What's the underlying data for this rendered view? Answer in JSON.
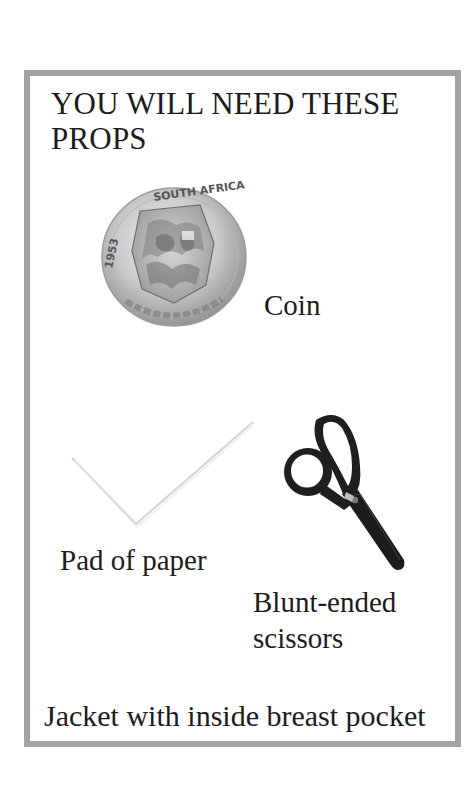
{
  "page": {
    "title": "YOU WILL NEED THESE PROPS",
    "title_lines": [
      "YOU WILL NEED THESE",
      "PROPS"
    ],
    "border_color": "#a3a3a3"
  },
  "props": [
    {
      "id": "coin",
      "label": "Coin",
      "icon": "coin-icon",
      "coin_text_top": "SOUTH AFRICA",
      "coin_text_date": "1953"
    },
    {
      "id": "pad",
      "label": "Pad of paper",
      "icon": "paper-pad-icon"
    },
    {
      "id": "scissors",
      "label_lines": [
        "Blunt-ended",
        "scissors"
      ],
      "label": "Blunt-ended scissors",
      "icon": "scissors-icon"
    },
    {
      "id": "jacket",
      "label": "Jacket with inside breast pocket"
    }
  ]
}
